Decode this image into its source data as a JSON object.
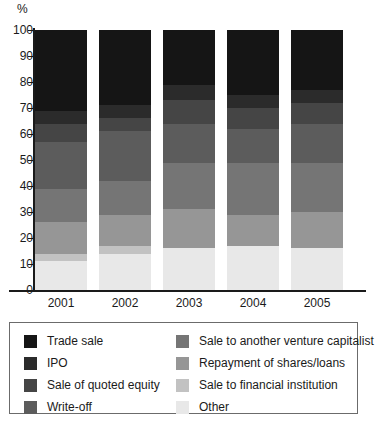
{
  "axis": {
    "y_unit_label": "%",
    "y_ticks": [
      "100",
      "90",
      "80",
      "70",
      "60",
      "50",
      "40",
      "30",
      "20",
      "10",
      "0"
    ],
    "x_ticks": [
      "2001",
      "2002",
      "2003",
      "2004",
      "2005"
    ]
  },
  "legend": {
    "column_left": [
      {
        "label": "Trade sale",
        "color": "#151515"
      },
      {
        "label": "IPO",
        "color": "#2b2b2b"
      },
      {
        "label": "Sale of quoted equity",
        "color": "#454545"
      },
      {
        "label": "Write-off",
        "color": "#5c5c5c"
      }
    ],
    "column_right": [
      {
        "label": "Sale to another venture capitalist",
        "color": "#757575"
      },
      {
        "label": "Repayment of shares/loans",
        "color": "#969696"
      },
      {
        "label": "Sale to financial institution",
        "color": "#c2c2c2"
      },
      {
        "label": "Other",
        "color": "#e8e8e8"
      }
    ]
  },
  "chart_data": {
    "type": "bar",
    "stacked": true,
    "title": "",
    "subtitle": "",
    "xlabel": "",
    "ylabel": "%",
    "ylim": [
      0,
      100
    ],
    "y_tick_step": 10,
    "grid": false,
    "legend_position": "bottom",
    "categories": [
      "2001",
      "2002",
      "2003",
      "2004",
      "2005"
    ],
    "series": [
      {
        "name": "Trade sale",
        "color": "#151515",
        "values": [
          31,
          29,
          21,
          25,
          23
        ]
      },
      {
        "name": "IPO",
        "color": "#2b2b2b",
        "values": [
          5,
          5,
          6,
          5,
          5
        ]
      },
      {
        "name": "Sale of quoted equity",
        "color": "#454545",
        "values": [
          7,
          5,
          9,
          8,
          8
        ]
      },
      {
        "name": "Write-off",
        "color": "#5c5c5c",
        "values": [
          18,
          19,
          15,
          13,
          15
        ]
      },
      {
        "name": "Sale to another venture capitalist",
        "color": "#757575",
        "values": [
          13,
          13,
          18,
          20,
          19
        ]
      },
      {
        "name": "Repayment of shares/loans",
        "color": "#969696",
        "values": [
          12,
          12,
          15,
          12,
          14
        ]
      },
      {
        "name": "Sale to financial institution",
        "color": "#c2c2c2",
        "values": [
          3,
          3,
          0,
          0,
          0
        ]
      },
      {
        "name": "Other",
        "color": "#e8e8e8",
        "values": [
          11,
          14,
          16,
          17,
          16
        ]
      }
    ]
  },
  "colors": {
    "axis": "#1a1a1a",
    "legend_border": "#6b6b6b",
    "background": "#ffffff"
  }
}
